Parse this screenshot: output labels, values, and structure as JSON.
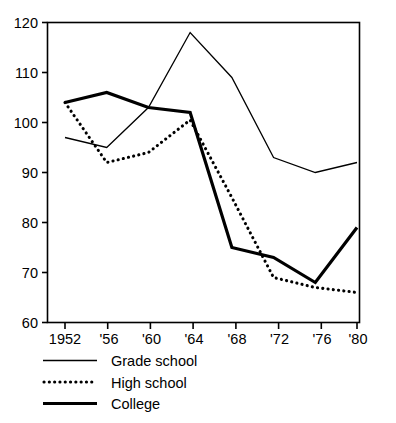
{
  "chart_data": {
    "type": "line",
    "title": "",
    "subtitle": "",
    "xlabel": "",
    "ylabel": "",
    "x": [
      1952,
      1956,
      1960,
      1964,
      1968,
      1972,
      1976,
      1980
    ],
    "categories": [
      "1952",
      "'56",
      "'60",
      "'64",
      "'68",
      "'72",
      "'76",
      "'80"
    ],
    "xtick_labels": [
      "1952",
      "'56",
      "'60",
      "'64",
      "'68",
      "'72",
      "'76",
      "'80"
    ],
    "ytick_labels": [
      "60",
      "70",
      "80",
      "90",
      "100",
      "110",
      "120"
    ],
    "ytick_values": [
      60,
      70,
      80,
      90,
      100,
      110,
      120
    ],
    "ylim": [
      60,
      120
    ],
    "xlim": [
      1952,
      1980
    ],
    "grid": false,
    "legend_position": "below-left",
    "series": [
      {
        "name": "Grade school",
        "style": "solid-thin",
        "color": "#000000",
        "values": [
          97,
          95,
          103,
          118,
          109,
          93,
          90,
          92
        ]
      },
      {
        "name": "High school",
        "style": "dotted",
        "color": "#000000",
        "values": [
          104,
          92,
          94,
          100.5,
          85,
          69,
          67,
          66
        ]
      },
      {
        "name": "College",
        "style": "solid-thick",
        "color": "#000000",
        "values": [
          104,
          106,
          103,
          102,
          75,
          73,
          68,
          79
        ]
      }
    ]
  },
  "axis": {
    "y_labels": [
      {
        "text": "120",
        "value": 120
      },
      {
        "text": "110",
        "value": 110
      },
      {
        "text": "100",
        "value": 100
      },
      {
        "text": "90",
        "value": 90
      },
      {
        "text": "80",
        "value": 80
      },
      {
        "text": "70",
        "value": 70
      },
      {
        "text": "60",
        "value": 60
      }
    ],
    "x_labels": [
      {
        "text": "1952",
        "value": 1952
      },
      {
        "text": "'56",
        "value": 1956
      },
      {
        "text": "'60",
        "value": 1960
      },
      {
        "text": "'64",
        "value": 1964
      },
      {
        "text": "'68",
        "value": 1968
      },
      {
        "text": "'72",
        "value": 1972
      },
      {
        "text": "'76",
        "value": 1976
      },
      {
        "text": "'80",
        "value": 1980
      }
    ]
  },
  "legend": {
    "items": [
      {
        "label": "Grade school",
        "style": "solid-thin"
      },
      {
        "label": "High school",
        "style": "dotted"
      },
      {
        "label": "College",
        "style": "solid-thick"
      }
    ]
  }
}
